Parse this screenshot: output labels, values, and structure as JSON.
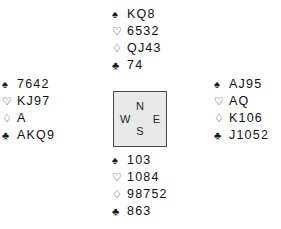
{
  "diagram": {
    "type": "bridge-hand-diagram",
    "colors": {
      "background": "#ffffff",
      "ink": "#111111",
      "compass_fill": "#e9e9e9",
      "compass_border": "#4a4a4a"
    },
    "suits": {
      "spade": "♠",
      "heart": "♡",
      "diamond": "♢",
      "club": "♣"
    },
    "suit_names": {
      "spade": "spade-suit-icon",
      "heart": "heart-suit-icon",
      "diamond": "diamond-suit-icon",
      "club": "club-suit-icon"
    },
    "compass": {
      "north": "N",
      "east": "E",
      "south": "S",
      "west": "W"
    },
    "hands": {
      "north": {
        "position": "North",
        "spades": "KQ8",
        "hearts": "6532",
        "diamonds": "QJ43",
        "clubs": "74"
      },
      "west": {
        "position": "West",
        "spades": "7642",
        "hearts": "KJ97",
        "diamonds": "A",
        "clubs": "AKQ9"
      },
      "east": {
        "position": "East",
        "spades": "AJ95",
        "hearts": "AQ",
        "diamonds": "K106",
        "clubs": "J1052"
      },
      "south": {
        "position": "South",
        "spades": "103",
        "hearts": "1084",
        "diamonds": "98752",
        "clubs": "863"
      }
    }
  }
}
